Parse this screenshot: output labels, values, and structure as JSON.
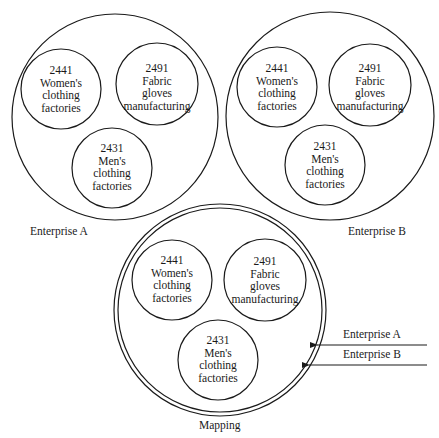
{
  "enterprises": [
    {
      "caption": "Enterprise A",
      "units": [
        {
          "code": "2441",
          "line1": "Women's",
          "line2": "clothing",
          "line3": "factories"
        },
        {
          "code": "2491",
          "line1": "Fabric",
          "line2": "gloves",
          "line3": "manufacturing"
        },
        {
          "code": "2431",
          "line1": "Men's",
          "line2": "clothing",
          "line3": "factories"
        }
      ]
    },
    {
      "caption": "Enterprise B",
      "units": [
        {
          "code": "2441",
          "line1": "Women's",
          "line2": "clothing",
          "line3": "factories"
        },
        {
          "code": "2491",
          "line1": "Fabric",
          "line2": "gloves",
          "line3": "manufacturing"
        },
        {
          "code": "2431",
          "line1": "Men's",
          "line2": "clothing",
          "line3": "factories"
        }
      ]
    }
  ],
  "mapping": {
    "caption": "Mapping",
    "units": [
      {
        "code": "2441",
        "line1": "Women's",
        "line2": "clothing",
        "line3": "factories"
      },
      {
        "code": "2491",
        "line1": "Fabric",
        "line2": "gloves",
        "line3": "manufacturing"
      },
      {
        "code": "2431",
        "line1": "Men's",
        "line2": "clothing",
        "line3": "factories"
      }
    ],
    "arrows": [
      {
        "label": "Enterprise A"
      },
      {
        "label": "Enterprise B"
      }
    ]
  }
}
